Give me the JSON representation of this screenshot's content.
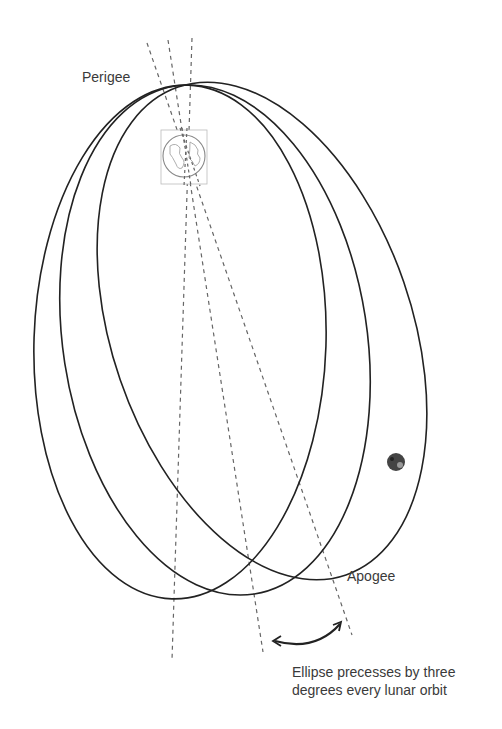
{
  "diagram": {
    "labels": {
      "perigee": "Perigee",
      "apogee": "Apogee"
    },
    "caption": {
      "line1": "Ellipse precesses by three",
      "line2": "degrees every lunar orbit"
    },
    "bodies": {
      "earth": "earth-icon",
      "moon": "moon-icon"
    },
    "orbits": [
      {
        "name": "orbit-1",
        "rotation_deg": 1.8
      },
      {
        "name": "orbit-2",
        "rotation_deg": -8.8
      },
      {
        "name": "orbit-3",
        "rotation_deg": -19
      }
    ],
    "colors": {
      "orbit_line": "#222222",
      "axis_dashes": "#555555",
      "text": "#3a3a3a"
    }
  }
}
